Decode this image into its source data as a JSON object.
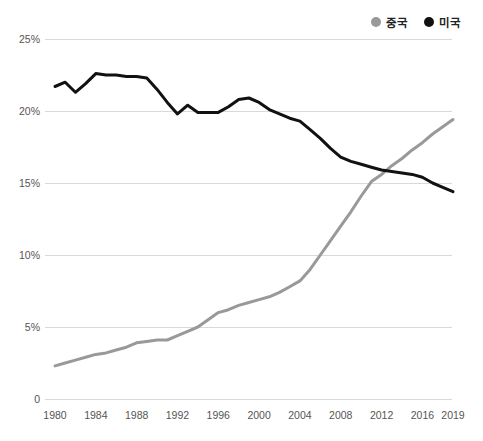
{
  "chart_data": {
    "type": "line",
    "title": "",
    "unit": "%",
    "grid": "horizontal",
    "legend_position": "top-right",
    "xlim": [
      1980,
      2019
    ],
    "ylim": [
      0,
      25
    ],
    "x": [
      1980,
      1981,
      1982,
      1983,
      1984,
      1985,
      1986,
      1987,
      1988,
      1989,
      1990,
      1991,
      1992,
      1993,
      1994,
      1995,
      1996,
      1997,
      1998,
      1999,
      2000,
      2001,
      2002,
      2003,
      2004,
      2005,
      2006,
      2007,
      2008,
      2009,
      2010,
      2011,
      2012,
      2013,
      2014,
      2015,
      2016,
      2017,
      2018,
      2019
    ],
    "series": [
      {
        "key": "china",
        "name": "중국",
        "color": "#999999",
        "values": [
          2.3,
          2.5,
          2.7,
          2.9,
          3.1,
          3.2,
          3.4,
          3.6,
          3.9,
          4.0,
          4.1,
          4.1,
          4.4,
          4.7,
          5.0,
          5.5,
          6.0,
          6.2,
          6.5,
          6.7,
          6.9,
          7.1,
          7.4,
          7.8,
          8.2,
          9.0,
          10.0,
          11.0,
          12.0,
          13.0,
          14.1,
          15.1,
          15.6,
          16.2,
          16.7,
          17.3,
          17.8,
          18.4,
          18.9,
          19.4
        ]
      },
      {
        "key": "usa",
        "name": "미국",
        "color": "#111111",
        "values": [
          21.7,
          22.0,
          21.3,
          21.9,
          22.6,
          22.5,
          22.5,
          22.4,
          22.4,
          22.3,
          21.5,
          20.6,
          19.8,
          20.4,
          19.9,
          19.9,
          19.9,
          20.3,
          20.8,
          20.9,
          20.6,
          20.1,
          19.8,
          19.5,
          19.3,
          18.7,
          18.1,
          17.4,
          16.8,
          16.5,
          16.3,
          16.1,
          15.9,
          15.8,
          15.7,
          15.6,
          15.4,
          15.0,
          14.7,
          14.4
        ]
      }
    ],
    "y_ticks": {
      "values": [
        0,
        5,
        10,
        15,
        20,
        25
      ],
      "labels": [
        "0",
        "5%",
        "10%",
        "15%",
        "20%",
        "25%"
      ]
    },
    "x_ticks": {
      "years": [
        1980,
        1984,
        1988,
        1992,
        1996,
        2000,
        2004,
        2008,
        2012,
        2016,
        2019
      ],
      "labels": [
        "1980",
        "1984",
        "1988",
        "1992",
        "1996",
        "2000",
        "2004",
        "2008",
        "2012",
        "2016",
        "2019"
      ]
    }
  }
}
